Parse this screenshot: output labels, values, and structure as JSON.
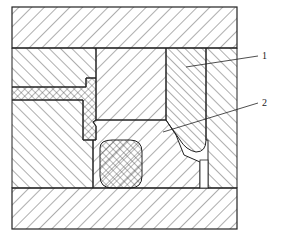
{
  "diagram": {
    "type": "mechanical-cross-section",
    "labels": [
      {
        "id": "1",
        "text": "1"
      },
      {
        "id": "2",
        "text": "2"
      }
    ],
    "colors": {
      "line": "#222222",
      "background": "#ffffff"
    }
  }
}
